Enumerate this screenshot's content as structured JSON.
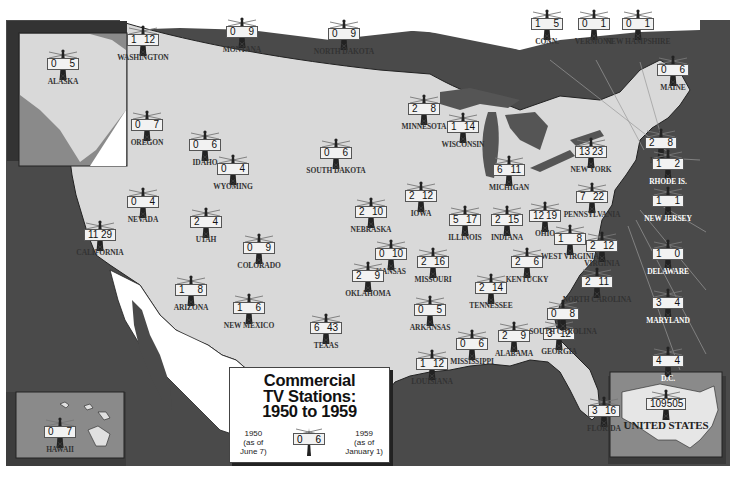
{
  "title": {
    "line1": "Commercial",
    "line2": "TV Stations:",
    "line3": "1950 to 1959"
  },
  "legend": {
    "left_year": "1950",
    "left_note1": "(as of",
    "left_note2": "June 7)",
    "right_year": "1959",
    "right_note1": "(as of",
    "right_note2": "January 1)",
    "sample_1950": "0",
    "sample_1959": "6"
  },
  "colors": {
    "land": "#d9d9d9",
    "water": "#4a4a4a",
    "inset_bg": "#8a8a8a",
    "label": "#333333"
  },
  "states": [
    {
      "name": "WASHINGTON",
      "v1950": "1",
      "v1959": "12"
    },
    {
      "name": "OREGON",
      "v1950": "0",
      "v1959": "7"
    },
    {
      "name": "IDAHO",
      "v1950": "0",
      "v1959": "6"
    },
    {
      "name": "MONTANA",
      "v1950": "0",
      "v1959": "9"
    },
    {
      "name": "NORTH DAKOTA",
      "v1950": "0",
      "v1959": "9"
    },
    {
      "name": "MINNESOTA",
      "v1950": "2",
      "v1959": "8"
    },
    {
      "name": "WISCONSIN",
      "v1950": "1",
      "v1959": "14"
    },
    {
      "name": "SOUTH DAKOTA",
      "v1950": "0",
      "v1959": "6"
    },
    {
      "name": "WYOMING",
      "v1950": "0",
      "v1959": "4"
    },
    {
      "name": "NEVADA",
      "v1950": "0",
      "v1959": "4"
    },
    {
      "name": "UTAH",
      "v1950": "2",
      "v1959": "4"
    },
    {
      "name": "CALIFORNIA",
      "v1950": "11",
      "v1959": "29"
    },
    {
      "name": "COLORADO",
      "v1950": "0",
      "v1959": "9"
    },
    {
      "name": "NEBRASKA",
      "v1950": "2",
      "v1959": "10"
    },
    {
      "name": "IOWA",
      "v1950": "2",
      "v1959": "12"
    },
    {
      "name": "ILLINOIS",
      "v1950": "5",
      "v1959": "17"
    },
    {
      "name": "KANSAS",
      "v1950": "0",
      "v1959": "10"
    },
    {
      "name": "MISSOURI",
      "v1950": "2",
      "v1959": "16"
    },
    {
      "name": "ARIZONA",
      "v1950": "1",
      "v1959": "8"
    },
    {
      "name": "NEW MEXICO",
      "v1950": "1",
      "v1959": "6"
    },
    {
      "name": "OKLAHOMA",
      "v1950": "2",
      "v1959": "9"
    },
    {
      "name": "TEXAS",
      "v1950": "6",
      "v1959": "43"
    },
    {
      "name": "ARKANSAS",
      "v1950": "0",
      "v1959": "5"
    },
    {
      "name": "LOUISIANA",
      "v1950": "1",
      "v1959": "12"
    },
    {
      "name": "MISSISSIPPI",
      "v1950": "0",
      "v1959": "6"
    },
    {
      "name": "ALABAMA",
      "v1950": "2",
      "v1959": "9"
    },
    {
      "name": "GEORGIA",
      "v1950": "3",
      "v1959": "12"
    },
    {
      "name": "FLORIDA",
      "v1950": "3",
      "v1959": "16"
    },
    {
      "name": "TENNESSEE",
      "v1950": "2",
      "v1959": "14"
    },
    {
      "name": "KENTUCKY",
      "v1950": "2",
      "v1959": "6"
    },
    {
      "name": "MICHIGAN",
      "v1950": "6",
      "v1959": "11"
    },
    {
      "name": "INDIANA",
      "v1950": "2",
      "v1959": "15"
    },
    {
      "name": "OHIO",
      "v1950": "12",
      "v1959": "19"
    },
    {
      "name": "WEST VIRGINIA",
      "v1950": "1",
      "v1959": "8"
    },
    {
      "name": "VIRGINIA",
      "v1950": "2",
      "v1959": "12"
    },
    {
      "name": "NORTH CAROLINA",
      "v1950": "2",
      "v1959": "11"
    },
    {
      "name": "SOUTH CAROLINA",
      "v1950": "0",
      "v1959": "8"
    },
    {
      "name": "PENNSYLVANIA",
      "v1950": "7",
      "v1959": "22"
    },
    {
      "name": "NEW YORK",
      "v1950": "13",
      "v1959": "23"
    },
    {
      "name": "CONN.",
      "v1950": "1",
      "v1959": "5"
    },
    {
      "name": "VERMONT",
      "v1950": "0",
      "v1959": "1"
    },
    {
      "name": "NEW HAMPSHIRE",
      "v1950": "0",
      "v1959": "1"
    },
    {
      "name": "MAINE",
      "v1950": "0",
      "v1959": "6"
    },
    {
      "name": "MASS.",
      "v1950": "2",
      "v1959": "8"
    },
    {
      "name": "RHODE IS.",
      "v1950": "1",
      "v1959": "2"
    },
    {
      "name": "NEW JERSEY",
      "v1950": "1",
      "v1959": "1"
    },
    {
      "name": "DELAWARE",
      "v1950": "1",
      "v1959": "0"
    },
    {
      "name": "MARYLAND",
      "v1950": "3",
      "v1959": "4"
    },
    {
      "name": "D.C.",
      "v1950": "4",
      "v1959": "4"
    },
    {
      "name": "ALASKA",
      "v1950": "0",
      "v1959": "5"
    },
    {
      "name": "HAWAII",
      "v1950": "0",
      "v1959": "7"
    }
  ],
  "us_total": {
    "name": "UNITED STATES",
    "v1950": "109",
    "v1959": "505"
  }
}
